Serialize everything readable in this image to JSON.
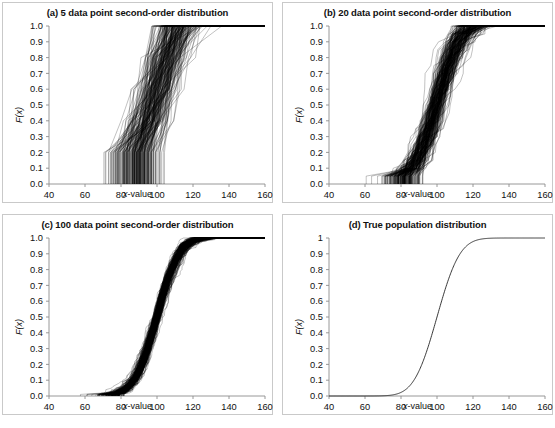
{
  "figure": {
    "panels": [
      {
        "id": "a",
        "title": "(a) 5 data point second-order distribution",
        "xlabel_italic": "x",
        "xlabel_rest": "-value",
        "ylabel": "F(x)",
        "xticks": [
          "40",
          "60",
          "80",
          "100",
          "120",
          "140",
          "160"
        ],
        "yticks": [
          "1.0",
          "0.9",
          "0.8",
          "0.7",
          "0.6",
          "0.5",
          "0.4",
          "0.3",
          "0.2",
          "0.1",
          "0.0"
        ]
      },
      {
        "id": "b",
        "title": "(b) 20 data point second-order distribution",
        "xlabel_italic": "x",
        "xlabel_rest": "-value",
        "ylabel": "F(x)",
        "xticks": [
          "40",
          "60",
          "80",
          "100",
          "120",
          "140",
          "160"
        ],
        "yticks": [
          "1.0",
          "0.9",
          "0.8",
          "0.7",
          "0.6",
          "0.5",
          "0.4",
          "0.3",
          "0.2",
          "0.1",
          "0.0"
        ]
      },
      {
        "id": "c",
        "title": "(c) 100 data point second-order distribution",
        "xlabel_italic": "x",
        "xlabel_rest": "-value",
        "ylabel": "F(x)",
        "xticks": [
          "40",
          "60",
          "80",
          "100",
          "120",
          "140",
          "160"
        ],
        "yticks": [
          "1.0",
          "0.9",
          "0.8",
          "0.7",
          "0.6",
          "0.5",
          "0.4",
          "0.3",
          "0.2",
          "0.1",
          "0.0"
        ]
      },
      {
        "id": "d",
        "title": "(d) True population distribution",
        "xlabel_italic": "x",
        "xlabel_rest": "-value",
        "ylabel": "F(x)",
        "xticks": [
          "40",
          "60",
          "80",
          "100",
          "120",
          "140",
          "160"
        ],
        "yticks": [
          "1",
          "0.9",
          "0.8",
          "0.7",
          "0.6",
          "0.5",
          "0.4",
          "0.3",
          "0.2",
          "0.1",
          "0.0"
        ]
      }
    ]
  },
  "chart_data": [
    {
      "type": "line",
      "panel": "a",
      "title": "(a) 5 data point second-order distribution",
      "xlabel": "x-value",
      "ylabel": "F(x)",
      "xlim": [
        40,
        160
      ],
      "ylim": [
        0.0,
        1.0
      ],
      "xticks": [
        40,
        60,
        80,
        100,
        120,
        140,
        160
      ],
      "yticks": [
        0.0,
        0.1,
        0.2,
        0.3,
        0.4,
        0.5,
        0.6,
        0.7,
        0.8,
        0.9,
        1.0
      ],
      "grid": false,
      "legend": "none",
      "description": "Overplotted empirical CDFs (spaghetti plot) from 200 bootstrap samples of 5 data points each; second-order uncertainty is very wide",
      "n_curves": 200,
      "sample_size": 5,
      "population": {
        "distribution": "normal",
        "mean": 100,
        "sd": 10
      },
      "envelope": {
        "x": [
          40,
          50,
          60,
          70,
          80,
          90,
          100,
          105,
          110,
          120,
          130,
          140,
          150,
          160
        ],
        "lower": [
          0.0,
          0.0,
          0.0,
          0.0,
          0.0,
          0.0,
          0.0,
          0.02,
          0.08,
          0.3,
          0.52,
          0.72,
          0.88,
          1.0
        ],
        "median": [
          0.0,
          0.0,
          0.01,
          0.03,
          0.07,
          0.14,
          0.32,
          0.62,
          0.9,
          0.95,
          0.97,
          0.98,
          0.99,
          1.0
        ],
        "upper": [
          0.0,
          0.02,
          0.1,
          0.23,
          0.38,
          0.56,
          0.82,
          1.0,
          1.0,
          1.0,
          1.0,
          1.0,
          1.0,
          1.0
        ]
      }
    },
    {
      "type": "line",
      "panel": "b",
      "title": "(b) 20 data point second-order distribution",
      "xlabel": "x-value",
      "ylabel": "F(x)",
      "xlim": [
        40,
        160
      ],
      "ylim": [
        0.0,
        1.0
      ],
      "xticks": [
        40,
        60,
        80,
        100,
        120,
        140,
        160
      ],
      "yticks": [
        0.0,
        0.1,
        0.2,
        0.3,
        0.4,
        0.5,
        0.6,
        0.7,
        0.8,
        0.9,
        1.0
      ],
      "grid": false,
      "legend": "none",
      "description": "Overplotted empirical CDFs from 200 bootstrap samples of 20 data points each; band is noticeably narrower than panel (a)",
      "n_curves": 200,
      "sample_size": 20,
      "population": {
        "distribution": "normal",
        "mean": 100,
        "sd": 10
      },
      "envelope": {
        "x": [
          40,
          50,
          60,
          70,
          80,
          90,
          95,
          100,
          105,
          110,
          120,
          130,
          140,
          150,
          160
        ],
        "lower": [
          0.0,
          0.0,
          0.0,
          0.0,
          0.0,
          0.0,
          0.02,
          0.25,
          0.6,
          0.78,
          0.86,
          0.9,
          0.93,
          0.96,
          0.99
        ],
        "median": [
          0.0,
          0.0,
          0.01,
          0.02,
          0.05,
          0.1,
          0.2,
          0.5,
          0.8,
          0.93,
          0.97,
          0.985,
          0.99,
          0.995,
          1.0
        ],
        "upper": [
          0.0,
          0.01,
          0.04,
          0.09,
          0.15,
          0.22,
          0.4,
          0.75,
          0.95,
          1.0,
          1.0,
          1.0,
          1.0,
          1.0,
          1.0
        ]
      }
    },
    {
      "type": "line",
      "panel": "c",
      "title": "(c) 100 data point second-order distribution",
      "xlabel": "x-value",
      "ylabel": "F(x)",
      "xlim": [
        40,
        160
      ],
      "ylim": [
        0.0,
        1.0
      ],
      "xticks": [
        40,
        60,
        80,
        100,
        120,
        140,
        160
      ],
      "yticks": [
        0.0,
        0.1,
        0.2,
        0.3,
        0.4,
        0.5,
        0.6,
        0.7,
        0.8,
        0.9,
        1.0
      ],
      "grid": false,
      "legend": "none",
      "description": "Overplotted empirical CDFs from 200 bootstrap samples of 100 data points each; band closely hugs the true population CDF",
      "n_curves": 200,
      "sample_size": 100,
      "population": {
        "distribution": "normal",
        "mean": 100,
        "sd": 10
      },
      "envelope": {
        "x": [
          40,
          60,
          70,
          80,
          85,
          90,
          95,
          100,
          105,
          110,
          115,
          120,
          130,
          140,
          150,
          160
        ],
        "lower": [
          0.0,
          0.0,
          0.0,
          0.01,
          0.02,
          0.06,
          0.2,
          0.42,
          0.65,
          0.84,
          0.92,
          0.94,
          0.95,
          0.96,
          0.975,
          0.99
        ],
        "median": [
          0.0,
          0.0,
          0.005,
          0.02,
          0.05,
          0.12,
          0.3,
          0.5,
          0.72,
          0.9,
          0.965,
          0.985,
          0.99,
          0.993,
          0.996,
          1.0
        ],
        "upper": [
          0.0,
          0.01,
          0.02,
          0.05,
          0.1,
          0.2,
          0.4,
          0.6,
          0.82,
          0.95,
          1.0,
          1.0,
          1.0,
          1.0,
          1.0,
          1.0
        ]
      }
    },
    {
      "type": "line",
      "panel": "d",
      "title": "(d) True population distribution",
      "xlabel": "x-value",
      "ylabel": "F(x)",
      "xlim": [
        40,
        160
      ],
      "ylim": [
        0.0,
        1.0
      ],
      "xticks": [
        40,
        60,
        80,
        100,
        120,
        140,
        160
      ],
      "yticks": [
        0.0,
        0.1,
        0.2,
        0.3,
        0.4,
        0.5,
        0.6,
        0.7,
        0.8,
        0.9,
        1
      ],
      "grid": false,
      "legend": "none",
      "description": "Single smooth S-shaped cumulative distribution function of the true population (normal, mean 100, sd 10)",
      "n_curves": 1,
      "population": {
        "distribution": "normal",
        "mean": 100,
        "sd": 10
      },
      "series": [
        {
          "name": "True population CDF",
          "x": [
            40,
            50,
            60,
            65,
            70,
            75,
            80,
            82,
            85,
            88,
            90,
            92,
            95,
            98,
            100,
            102,
            105,
            108,
            110,
            112,
            115,
            118,
            120,
            125,
            130,
            140,
            150,
            160
          ],
          "y": [
            0.0,
            0.0,
            0.0,
            0.0002,
            0.0013,
            0.0062,
            0.0228,
            0.0359,
            0.0668,
            0.1151,
            0.1587,
            0.2119,
            0.3085,
            0.4207,
            0.5,
            0.5793,
            0.6915,
            0.7881,
            0.8413,
            0.8849,
            0.9332,
            0.9641,
            0.9772,
            0.9938,
            0.9987,
            1.0,
            1.0,
            1.0
          ]
        }
      ]
    }
  ]
}
